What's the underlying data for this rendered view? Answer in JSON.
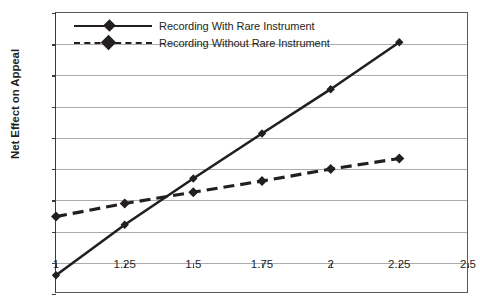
{
  "chart_data": {
    "type": "line",
    "title": "",
    "xlabel": "",
    "ylabel": "Net Effect on Appeal",
    "xlim": [
      1,
      2.5
    ],
    "ylim": [
      -0.5,
      4
    ],
    "grid": true,
    "legend_position": "top-left-inside",
    "x": [
      1,
      1.25,
      1.5,
      1.75,
      2,
      2.25
    ],
    "xticks": [
      "1",
      "1.25",
      "1.5",
      "1.75",
      "2",
      "2.25",
      "2.5"
    ],
    "xtick_values": [
      1,
      1.25,
      1.5,
      1.75,
      2,
      2.25,
      2.5
    ],
    "yticks": [
      "-0.5",
      "0",
      "0.5",
      "1",
      "1.5",
      "2",
      "2.5",
      "3",
      "3.5",
      "4"
    ],
    "ytick_values": [
      -0.5,
      0,
      0.5,
      1,
      1.5,
      2,
      2.5,
      3,
      3.5,
      4
    ],
    "series": [
      {
        "name": "Recording With Rare Instrument",
        "style": "solid",
        "marker": "diamond",
        "color": "#231f20",
        "values": [
          -0.2,
          0.61,
          1.35,
          2.07,
          2.78,
          3.53
        ]
      },
      {
        "name": "Recording Without Rare Instrument",
        "style": "dashed",
        "marker": "diamond",
        "color": "#231f20",
        "values": [
          0.74,
          0.95,
          1.13,
          1.31,
          1.5,
          1.67
        ]
      }
    ]
  },
  "legend": {
    "items": [
      {
        "label": "Recording With Rare Instrument",
        "style": "solid"
      },
      {
        "label": "Recording Without Rare Instrument",
        "style": "dashed"
      }
    ]
  },
  "axes": {
    "y_title": "Net Effect on Appeal"
  },
  "colors": {
    "series": "#231f20",
    "gridline": "#aaabad",
    "frame": "#58595b",
    "background": "#ffffff"
  }
}
